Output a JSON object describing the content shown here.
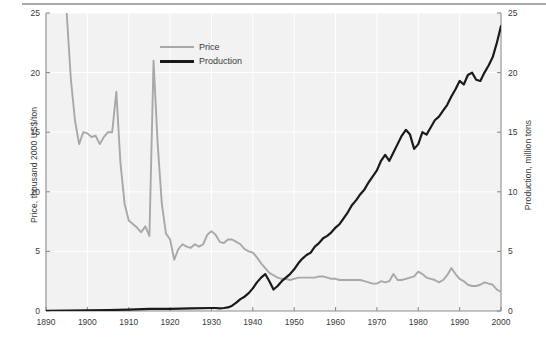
{
  "figure": {
    "background": "#ffffff",
    "plot_background": "#f2f2f2",
    "gridline_color": "#ffffff",
    "axis_color": "#8c8c8c",
    "text_color": "#3a3a3a"
  },
  "legend": {
    "position": "top-center-right",
    "entries": [
      {
        "label": "Price",
        "color": "#a8a8a8"
      },
      {
        "label": "Production",
        "color": "#1a1a1a"
      }
    ]
  },
  "chart_data": {
    "type": "line",
    "title": "",
    "xlabel": "",
    "ylabel": "Price, thousand 2000 US$/ton",
    "y2label": "Production, million tons",
    "xlim": [
      1890,
      2000
    ],
    "ylim": [
      0,
      25
    ],
    "y2lim": [
      0,
      25
    ],
    "grid": true,
    "xticks": [
      1890,
      1900,
      1910,
      1920,
      1930,
      1940,
      1950,
      1960,
      1970,
      1980,
      1990,
      2000
    ],
    "xticklabels": [
      "1890",
      "1900",
      "1910",
      "1920",
      "1930",
      "1940",
      "1950",
      "1960",
      "1970",
      "1980",
      "1990",
      "2000"
    ],
    "yticks": [
      0,
      5,
      10,
      15,
      20,
      25
    ],
    "yticklabels": [
      "0",
      "5",
      "10",
      "15",
      "20",
      "25"
    ],
    "y2ticks": [
      0,
      5,
      10,
      15,
      20,
      25
    ],
    "y2ticklabels": [
      "0",
      "5",
      "10",
      "15",
      "20",
      "25"
    ],
    "series": [
      {
        "name": "Price",
        "color": "#a8a8a8",
        "axis": "left",
        "units": "thousand 2000 US$/ton",
        "x": [
          1894,
          1895,
          1896,
          1897,
          1898,
          1899,
          1900,
          1901,
          1902,
          1903,
          1904,
          1905,
          1906,
          1907,
          1908,
          1909,
          1910,
          1911,
          1912,
          1913,
          1914,
          1915,
          1916,
          1917,
          1918,
          1919,
          1920,
          1921,
          1922,
          1923,
          1924,
          1925,
          1926,
          1927,
          1928,
          1929,
          1930,
          1931,
          1932,
          1933,
          1934,
          1935,
          1936,
          1937,
          1938,
          1939,
          1940,
          1941,
          1942,
          1943,
          1944,
          1945,
          1946,
          1947,
          1948,
          1949,
          1950,
          1951,
          1952,
          1953,
          1954,
          1955,
          1956,
          1957,
          1958,
          1959,
          1960,
          1961,
          1962,
          1963,
          1964,
          1965,
          1966,
          1967,
          1968,
          1969,
          1970,
          1971,
          1972,
          1973,
          1974,
          1975,
          1976,
          1977,
          1978,
          1979,
          1980,
          1981,
          1982,
          1983,
          1984,
          1985,
          1986,
          1987,
          1988,
          1989,
          1990,
          1991,
          1992,
          1993,
          1994,
          1995,
          1996,
          1997,
          1998,
          1999,
          2000
        ],
        "y": [
          30.0,
          25.0,
          19.5,
          16.0,
          14.0,
          15.0,
          14.9,
          14.6,
          14.7,
          14.0,
          14.6,
          15.0,
          15.0,
          18.4,
          12.4,
          9.0,
          7.6,
          7.3,
          7.0,
          6.6,
          7.1,
          6.3,
          21.0,
          14.0,
          9.0,
          6.5,
          6.0,
          4.3,
          5.2,
          5.6,
          5.4,
          5.3,
          5.6,
          5.4,
          5.6,
          6.4,
          6.7,
          6.4,
          5.8,
          5.7,
          6.0,
          6.0,
          5.8,
          5.6,
          5.2,
          5.0,
          4.9,
          4.5,
          4.0,
          3.6,
          3.2,
          3.0,
          2.8,
          2.7,
          2.7,
          2.6,
          2.7,
          2.8,
          2.8,
          2.8,
          2.8,
          2.8,
          2.9,
          2.9,
          2.8,
          2.7,
          2.7,
          2.6,
          2.6,
          2.6,
          2.6,
          2.6,
          2.6,
          2.5,
          2.4,
          2.3,
          2.3,
          2.5,
          2.4,
          2.5,
          3.1,
          2.6,
          2.6,
          2.7,
          2.8,
          2.9,
          3.3,
          3.1,
          2.8,
          2.7,
          2.6,
          2.4,
          2.6,
          3.0,
          3.6,
          3.1,
          2.7,
          2.5,
          2.2,
          2.1,
          2.1,
          2.2,
          2.4,
          2.3,
          2.2,
          1.8,
          1.6
        ]
      },
      {
        "name": "Production",
        "color": "#1a1a1a",
        "axis": "right",
        "units": "million tons",
        "x": [
          1890,
          1895,
          1900,
          1905,
          1910,
          1915,
          1920,
          1925,
          1930,
          1931,
          1932,
          1933,
          1934,
          1935,
          1936,
          1937,
          1938,
          1939,
          1940,
          1941,
          1942,
          1943,
          1944,
          1945,
          1946,
          1947,
          1948,
          1949,
          1950,
          1951,
          1952,
          1953,
          1954,
          1955,
          1956,
          1957,
          1958,
          1959,
          1960,
          1961,
          1962,
          1963,
          1964,
          1965,
          1966,
          1967,
          1968,
          1969,
          1970,
          1971,
          1972,
          1973,
          1974,
          1975,
          1976,
          1977,
          1978,
          1979,
          1980,
          1981,
          1982,
          1983,
          1984,
          1985,
          1986,
          1987,
          1988,
          1989,
          1990,
          1991,
          1992,
          1993,
          1994,
          1995,
          1996,
          1997,
          1998,
          1999,
          2000
        ],
        "y": [
          0.02,
          0.03,
          0.05,
          0.08,
          0.12,
          0.18,
          0.18,
          0.22,
          0.25,
          0.25,
          0.22,
          0.25,
          0.3,
          0.45,
          0.7,
          1.0,
          1.2,
          1.5,
          1.9,
          2.4,
          2.8,
          3.1,
          2.5,
          1.8,
          2.1,
          2.5,
          2.8,
          3.1,
          3.5,
          4.0,
          4.4,
          4.7,
          4.9,
          5.4,
          5.7,
          6.1,
          6.3,
          6.6,
          7.0,
          7.3,
          7.8,
          8.3,
          8.9,
          9.3,
          9.8,
          10.2,
          10.8,
          11.3,
          11.8,
          12.6,
          13.1,
          12.6,
          13.3,
          14.0,
          14.7,
          15.2,
          14.8,
          13.6,
          14.0,
          15.0,
          14.8,
          15.4,
          16.0,
          16.3,
          16.8,
          17.3,
          18.0,
          18.6,
          19.3,
          19.0,
          19.8,
          20.0,
          19.4,
          19.3,
          20.0,
          20.6,
          21.3,
          22.5,
          23.9
        ]
      }
    ]
  }
}
